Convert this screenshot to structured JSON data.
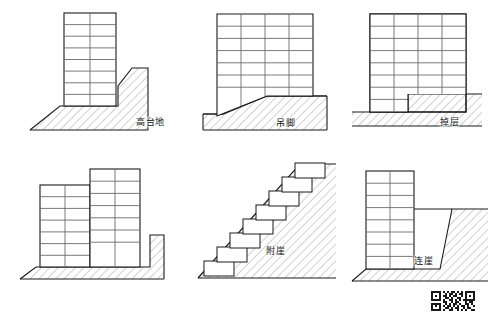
{
  "figure": {
    "title": "",
    "type": "architectural-section-diagram",
    "colors": {
      "outline": "#1a1a1a",
      "floor_line": "#6b6b6b",
      "hatch": "#8a8a8a",
      "ground_line": "#1a1a1a",
      "background": "#ffffff",
      "label_text": "#111111"
    }
  },
  "panels": [
    {
      "id": "panel-1",
      "label": "高台地",
      "building": {
        "floors": 8,
        "bays": 2
      },
      "terrain": "raised platform with cut bank on right",
      "position": {
        "row": 1,
        "col": 1
      }
    },
    {
      "id": "panel-2",
      "label": "吊脚",
      "building": {
        "floors": 7,
        "bays": 4
      },
      "terrain": "sloping ground rising to the right, building stilted on lower side",
      "position": {
        "row": 1,
        "col": 2
      }
    },
    {
      "id": "panel-3",
      "label": "掉层",
      "building": {
        "floors": 8,
        "bays": 4
      },
      "terrain": "stepped ground, lower floors embedded into upper terrace",
      "position": {
        "row": 1,
        "col": 3
      }
    },
    {
      "id": "panel-4",
      "label": "错层",
      "building": {
        "floors": 7,
        "bays": 4,
        "blocks": 2
      },
      "terrain": "two offset blocks on stepped ground with cut bank",
      "position": {
        "row": 2,
        "col": 1
      }
    },
    {
      "id": "panel-5",
      "label": "附崖",
      "building": {
        "steps": 8,
        "bays": 1
      },
      "terrain": "stepped terraces climbing a steep 45 degree slope",
      "position": {
        "row": 2,
        "col": 2
      }
    },
    {
      "id": "panel-6",
      "label": "连崖",
      "building": {
        "floors": 8,
        "bays": 2
      },
      "terrain": "building connected to cliff face by a bridging deck",
      "position": {
        "row": 2,
        "col": 3
      }
    }
  ],
  "watermark": {
    "type": "qr-code",
    "label": "qr-code"
  }
}
